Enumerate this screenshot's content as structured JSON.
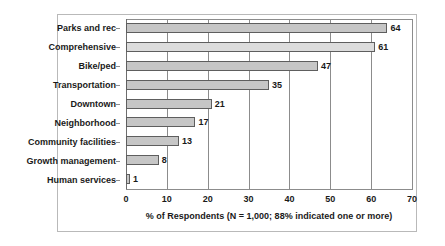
{
  "chart_data": {
    "type": "bar",
    "orientation": "horizontal",
    "title": "",
    "categories": [
      "Parks and rec",
      "Comprehensive",
      "Bike/ped",
      "Transportation",
      "Downtown",
      "Neighborhood",
      "Community facilities",
      "Growth management",
      "Human services"
    ],
    "values": [
      64,
      61,
      47,
      35,
      21,
      17,
      13,
      8,
      1
    ],
    "data_labels": [
      "64",
      "61",
      "47",
      "35",
      "21",
      "17",
      "13",
      "8",
      "1"
    ],
    "xlabel": "% of Respondents (N = 1,000; 88%  indicated one or more)",
    "ylabel": "",
    "xlim": [
      0,
      70
    ],
    "xticks": [
      0,
      10,
      20,
      30,
      40,
      50,
      60,
      70
    ],
    "xtick_labels": [
      "0",
      "10",
      "20",
      "30",
      "40",
      "50",
      "60",
      "70"
    ],
    "grid": "vertical",
    "legend": "none",
    "colors": {
      "bar_fill": "#c6c6c6",
      "bar_fill_alt": "#dcdcdc",
      "bar_border": "#5e5e5e",
      "gridline": "#8c8c8c",
      "frame": "#b9b9b9",
      "text": "#1a1a1a",
      "background": "#ffffff"
    }
  }
}
